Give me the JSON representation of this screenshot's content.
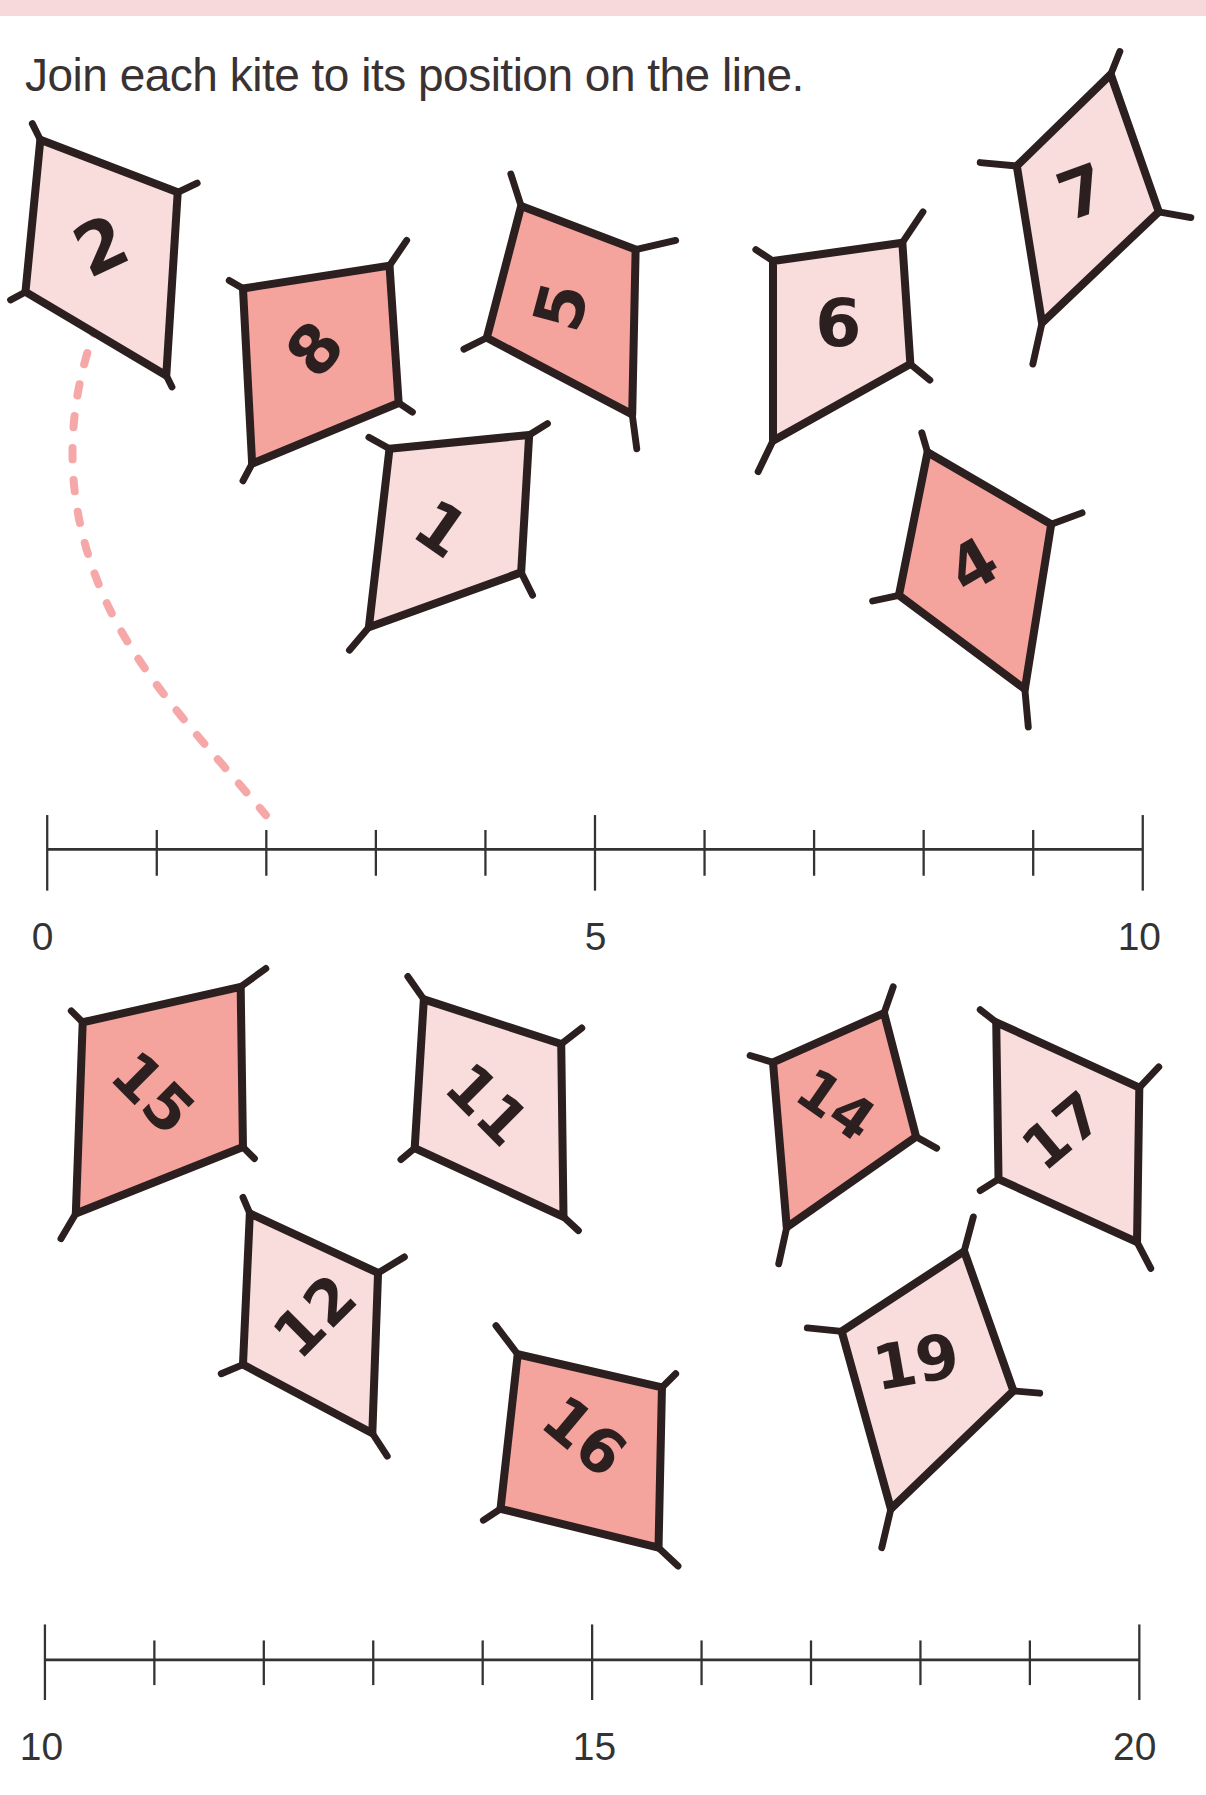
{
  "header": {
    "band_color": "#f8d9db"
  },
  "instruction": "Join each kite to its position on the line.",
  "colors": {
    "light_kite": "#f9dcdc",
    "dark_kite": "#f4a39d",
    "outline": "#2b1f1f",
    "dashed_line": "#f6a8a8"
  },
  "number_lines": [
    {
      "id": "line-0-10",
      "start": 0,
      "end": 10,
      "labels": [
        "0",
        "5",
        "10"
      ]
    },
    {
      "id": "line-10-20",
      "start": 10,
      "end": 20,
      "labels": [
        "10",
        "15",
        "20"
      ]
    }
  ],
  "kites_top": [
    {
      "label": "2",
      "shade": "light"
    },
    {
      "label": "8",
      "shade": "dark"
    },
    {
      "label": "5",
      "shade": "dark"
    },
    {
      "label": "6",
      "shade": "light"
    },
    {
      "label": "7",
      "shade": "light"
    },
    {
      "label": "1",
      "shade": "light"
    },
    {
      "label": "4",
      "shade": "dark"
    }
  ],
  "kites_bottom": [
    {
      "label": "15",
      "shade": "dark"
    },
    {
      "label": "11",
      "shade": "light"
    },
    {
      "label": "12",
      "shade": "light"
    },
    {
      "label": "16",
      "shade": "dark"
    },
    {
      "label": "14",
      "shade": "dark"
    },
    {
      "label": "17",
      "shade": "light"
    },
    {
      "label": "19",
      "shade": "light"
    }
  ],
  "example_connection": {
    "from_kite": "2",
    "to_position": 2
  }
}
